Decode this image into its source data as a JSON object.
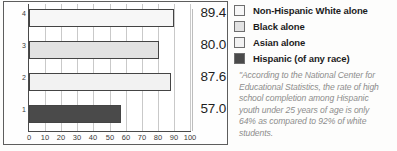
{
  "chart_data": {
    "type": "bar",
    "orientation": "horizontal",
    "title": "",
    "subtitle": "",
    "xlabel": "",
    "ylabel": "",
    "categories": [
      "1",
      "2",
      "3",
      "4"
    ],
    "category_names": [
      "Hispanic (of any race)",
      "Asian alone",
      "Black alone",
      "Non-Hispanic White alone"
    ],
    "values": [
      57.0,
      87.6,
      80.0,
      89.4
    ],
    "value_labels": [
      "57.0",
      "87.6",
      "80.0",
      "89.4"
    ],
    "bar_colors": [
      "#4a4a4a",
      "#f2f2f2",
      "#e2e2e2",
      "#f7f7f7"
    ],
    "bar_border_color": "#444444",
    "xlim": [
      0,
      100
    ],
    "xticks": [
      "0",
      "10",
      "20",
      "30",
      "40",
      "50",
      "60",
      "70",
      "80",
      "90",
      "100"
    ],
    "xtick_values": [
      0,
      10,
      20,
      30,
      40,
      50,
      60,
      70,
      80,
      90,
      100
    ],
    "yticks": [
      "4",
      "3",
      "2",
      "1"
    ],
    "grid": true,
    "grid_axis": "x",
    "legend_position": "right"
  },
  "legend": {
    "items": [
      {
        "label": "Non-Hispanic White alone",
        "color": "#f7f7f7"
      },
      {
        "label": "Black alone",
        "color": "#e2e2e2"
      },
      {
        "label": "Asian alone",
        "color": "#f2f2f2"
      },
      {
        "label": "Hispanic (of any race)",
        "color": "#4a4a4a"
      }
    ]
  },
  "footnote": {
    "lines": [
      "\"According to the National Center for",
      "Educational Statistics, the rate of high",
      "school completion among Hispanic",
      "youth under 25 years of age is only",
      "64% as compared to 92% of white",
      "students."
    ],
    "text": "\"According to the National Center for Educational Statistics, the rate of high school completion among Hispanic youth under 25 years of age is only 64% as compared to 92% of white students."
  },
  "colors": {
    "background": "#fdfdfc",
    "frame": "#5d5d5d",
    "axis": "#4a4a4a",
    "gridline": "#c9c9c9",
    "text": "#1e1e1e",
    "footnote_text": "#8d8d8d"
  }
}
